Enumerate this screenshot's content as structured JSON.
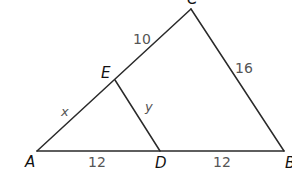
{
  "diagram": {
    "type": "triangle-with-segment",
    "vertices": {
      "A": {
        "label": "A",
        "x": 37,
        "y": 151
      },
      "B": {
        "label": "B",
        "x": 284,
        "y": 151
      },
      "C": {
        "label": "C",
        "x": 191,
        "y": 9
      },
      "D": {
        "label": "D",
        "x": 160,
        "y": 151
      },
      "E": {
        "label": "E",
        "x": 115,
        "y": 80
      }
    },
    "segments": [
      {
        "from": "A",
        "to": "B"
      },
      {
        "from": "A",
        "to": "C"
      },
      {
        "from": "C",
        "to": "B"
      },
      {
        "from": "E",
        "to": "D"
      }
    ],
    "labels": {
      "AE": "x",
      "EC": "10",
      "CB": "16",
      "ED": "y",
      "AD": "12",
      "DB": "12"
    },
    "colors": {
      "line": "#2a2a2a",
      "vertex_label": "#111111",
      "measure_label": "#555555",
      "background": "#ffffff"
    }
  }
}
